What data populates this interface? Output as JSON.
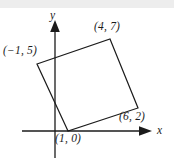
{
  "figure": {
    "background_color": "#ffffff",
    "band_color": "#ededed",
    "stroke_color": "#1b1b1b"
  },
  "axes": {
    "x_label": "x",
    "y_label": "y",
    "x_axis_pixel_y": 131,
    "y_axis_pixel_x": 55,
    "x_axis_start_px": 22,
    "x_axis_end_px": 152,
    "y_axis_top_px": 20,
    "y_axis_bottom_px": 158
  },
  "chart_data": {
    "type": "scatter",
    "title": "",
    "xlabel": "x",
    "ylabel": "y",
    "grid": false,
    "legend": null,
    "shape": "square",
    "vertices": [
      {
        "label": "(−1, 5)",
        "x": -1,
        "y": 5,
        "px": 37,
        "py": 64
      },
      {
        "label": "(4, 7)",
        "x": 4,
        "y": 7,
        "px": 110,
        "py": 39
      },
      {
        "label": "(6, 2)",
        "x": 6,
        "y": 2,
        "px": 138,
        "py": 108
      },
      {
        "label": "(1, 0)",
        "x": 1,
        "y": 0,
        "px": 68,
        "py": 131
      }
    ],
    "edges": [
      [
        0,
        1
      ],
      [
        1,
        2
      ],
      [
        2,
        3
      ],
      [
        3,
        0
      ]
    ]
  },
  "labels": {
    "v1": "(−1, 5)",
    "v2": "(4, 7)",
    "v3": "(6, 2)",
    "v4": "(1, 0)",
    "x_axis": "x",
    "y_axis": "y"
  }
}
